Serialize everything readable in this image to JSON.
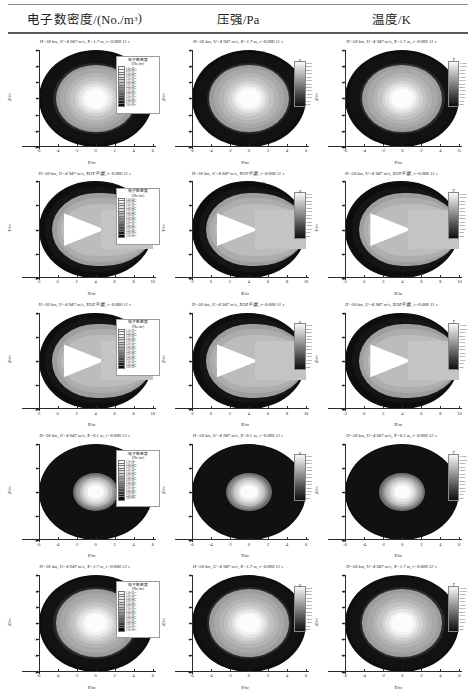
{
  "figure": {
    "columns": [
      {
        "id": "ne",
        "title_main": "电子数密度/(No./m",
        "title_sup": "3",
        "title_tail": ")"
      },
      {
        "id": "p",
        "title_main": "压强/Pa",
        "title_sup": "",
        "title_tail": ""
      },
      {
        "id": "T",
        "title_main": "温度/K",
        "title_sup": "",
        "title_tail": ""
      }
    ],
    "rows": [
      {
        "id": "r1",
        "plane": "YZ",
        "x_station": "X=1.7 m",
        "time": "t=0.000 11 s",
        "caption": "H=50 km, U=4 947 m/s, X=1.7 m, t=0.000 11 s",
        "xlabel": "Y/m",
        "ylabel": "Z/m",
        "xticks": [
          "-6",
          "-4",
          "-2",
          "0",
          "2",
          "4",
          "6"
        ],
        "yticks": [
          "-6",
          "-4",
          "-2",
          "0",
          "2",
          "4",
          "6"
        ],
        "xlim": [
          -7,
          7
        ],
        "ylim": [
          -7,
          7
        ],
        "style": "annulus"
      },
      {
        "id": "r2",
        "plane": "XOY平面",
        "x_station": "",
        "time": "t=0.000 11 s",
        "caption": "H=50 km, U=4 947 m/s, XOY平面, t=0.000 11 s",
        "xlabel": "X/m",
        "ylabel": "Y/m",
        "xticks": [
          "-2",
          "0",
          "2",
          "4",
          "6",
          "8",
          "10"
        ],
        "yticks": [
          "-4",
          "-2",
          "0",
          "2",
          "4"
        ],
        "xlim": [
          -3,
          11
        ],
        "ylim": [
          -6,
          6
        ],
        "style": "bullet"
      },
      {
        "id": "r3",
        "plane": "XOZ平面",
        "x_station": "",
        "time": "t=0.000 11 s",
        "caption": "H=50 km, U=4 947 m/s, XOZ平面, t=0.000 11 s",
        "xlabel": "X/m",
        "ylabel": "Z/m",
        "xticks": [
          "-2",
          "0",
          "2",
          "4",
          "6",
          "8",
          "10"
        ],
        "yticks": [
          "-4",
          "-2",
          "0",
          "2",
          "4"
        ],
        "xlim": [
          -3,
          11
        ],
        "ylim": [
          -6,
          6
        ],
        "style": "bullet"
      },
      {
        "id": "r4",
        "plane": "YZ",
        "x_station": "X=0.1 m",
        "time": "t=0.000 12 s",
        "caption": "H=50 km, U=4 947 m/s, X=0.1 m, t=0.000 12 s",
        "xlabel": "Y/m",
        "ylabel": "Z/m",
        "xticks": [
          "-6",
          "-4",
          "-2",
          "0",
          "2",
          "4",
          "6"
        ],
        "yticks": [
          "-4",
          "-2",
          "0",
          "2",
          "4"
        ],
        "xlim": [
          -7,
          7
        ],
        "ylim": [
          -6,
          6
        ],
        "style": "annulus-small"
      },
      {
        "id": "r5",
        "plane": "YZ",
        "x_station": "X=1.7 m",
        "time": "t=0.000 12 s",
        "caption": "H=50 km, U=4 947 m/s, X=1.7 m, t=0.000 12 s",
        "xlabel": "Y/m",
        "ylabel": "Z/m",
        "xticks": [
          "-6",
          "-4",
          "-2",
          "0",
          "2",
          "4",
          "6"
        ],
        "yticks": [
          "-6",
          "-4",
          "-2",
          "0",
          "2",
          "4",
          "6"
        ],
        "xlim": [
          -7,
          7
        ],
        "ylim": [
          -7,
          7
        ],
        "style": "annulus"
      }
    ],
    "legend_ne": {
      "title": "电子数密度",
      "units": "/(No./m³)",
      "entries": [
        "1.0×10¹⁹",
        "5.0×10¹⁸",
        "1.0×10¹⁸",
        "5.0×10¹⁷",
        "1.0×10¹⁷",
        "5.0×10¹⁶",
        "1.0×10¹⁶",
        "5.0×10¹⁵",
        "1.0×10¹⁵",
        "5.0×10¹⁴",
        "1.0×10¹⁴",
        "5.0×10¹³",
        "1.0×10¹³",
        "5.0×10¹²",
        "1.0×10¹²"
      ]
    },
    "legend_p": {
      "title": "p",
      "entries": [
        "5000",
        "4600",
        "4200",
        "3800",
        "3400",
        "3000",
        "2600",
        "2200",
        "1800",
        "1400",
        "1000",
        "600",
        "200"
      ]
    },
    "legend_T": {
      "title": "T",
      "entries": [
        "11000",
        "10000",
        "9000",
        "8000",
        "7000",
        "6000",
        "5000",
        "4000",
        "3000",
        "2000",
        "1000",
        "500",
        "250"
      ]
    },
    "common": {
      "altitude": "H=50 km",
      "velocity": "U=4 947 m/s"
    }
  },
  "chart_data": {
    "type": "heatmap",
    "grid": {
      "rows": 5,
      "cols": 3
    },
    "column_quantities": [
      {
        "name": "电子数密度",
        "symbol": "ne",
        "unit": "No./m³"
      },
      {
        "name": "压强",
        "symbol": "p",
        "unit": "Pa"
      },
      {
        "name": "温度",
        "symbol": "T",
        "unit": "K"
      }
    ],
    "row_conditions": [
      {
        "plane": "YZ",
        "station": "X=1.7 m",
        "time_s": 0.00011,
        "altitude_km": 50,
        "velocity_mps": 4947
      },
      {
        "plane": "XOY",
        "station": "",
        "time_s": 0.00011,
        "altitude_km": 50,
        "velocity_mps": 4947
      },
      {
        "plane": "XOZ",
        "station": "",
        "time_s": 0.00011,
        "altitude_km": 50,
        "velocity_mps": 4947
      },
      {
        "plane": "YZ",
        "station": "X=0.1 m",
        "time_s": 0.00012,
        "altitude_km": 50,
        "velocity_mps": 4947
      },
      {
        "plane": "YZ",
        "station": "X=1.7 m",
        "time_s": 0.00012,
        "altitude_km": 50,
        "velocity_mps": 4947
      }
    ],
    "axes": {
      "cross_section": {
        "xlabel": "Y/m",
        "ylabel": "Z/m",
        "xlim": [
          -7,
          7
        ],
        "ylim": [
          -7,
          7
        ],
        "xticks": [
          -6,
          -4,
          -2,
          0,
          2,
          4,
          6
        ],
        "yticks": [
          -6,
          -4,
          -2,
          0,
          2,
          4,
          6
        ]
      },
      "longitudinal": {
        "xlabel": "X/m",
        "ylabel": "Y/m or Z/m",
        "xlim": [
          -3,
          11
        ],
        "ylim": [
          -6,
          6
        ],
        "xticks": [
          -2,
          0,
          2,
          4,
          6,
          8,
          10
        ],
        "yticks": [
          -4,
          -2,
          0,
          2,
          4
        ]
      }
    },
    "colorscale": "grayscale",
    "ne_levels": [
      1000000000000.0,
      5000000000000.0,
      10000000000000.0,
      50000000000000.0,
      100000000000000.0,
      500000000000000.0,
      1000000000000000.0,
      5000000000000000.0,
      1e+16,
      5e+16,
      1e+17,
      5e+17,
      1e+18,
      5e+18,
      1e+19
    ],
    "p_levels": [
      200,
      600,
      1000,
      1400,
      1800,
      2200,
      2600,
      3000,
      3400,
      3800,
      4200,
      4600,
      5000
    ],
    "T_levels": [
      250,
      500,
      1000,
      2000,
      3000,
      4000,
      5000,
      6000,
      7000,
      8000,
      9000,
      10000,
      11000
    ],
    "grid_on": false,
    "legend_position": "inset-right"
  }
}
